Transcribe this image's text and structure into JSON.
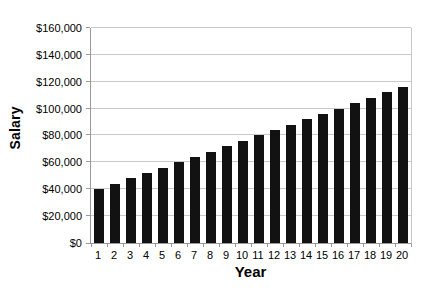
{
  "chart_data": {
    "type": "bar",
    "title": "",
    "xlabel": "Year",
    "ylabel": "Salary",
    "categories": [
      "1",
      "2",
      "3",
      "4",
      "5",
      "6",
      "7",
      "8",
      "9",
      "10",
      "11",
      "12",
      "13",
      "14",
      "15",
      "16",
      "17",
      "18",
      "19",
      "20"
    ],
    "values": [
      40000,
      44000,
      48000,
      52000,
      56000,
      60000,
      64000,
      68000,
      72000,
      76000,
      80000,
      84000,
      88000,
      92000,
      96000,
      100000,
      104000,
      108000,
      112000,
      116000
    ],
    "ylim": [
      0,
      160000
    ],
    "y_tick_step": 20000,
    "y_tick_labels": [
      "$0",
      "$20,000",
      "$40,000",
      "$60,000",
      "$80,000",
      "$100,000",
      "$120,000",
      "$140,000",
      "$160,000"
    ],
    "grid": true,
    "legend": "none",
    "bar_color": "#121212",
    "gridline_color": "#c9c9c9",
    "axis_color": "#999999",
    "background_color": "#ffffff"
  }
}
